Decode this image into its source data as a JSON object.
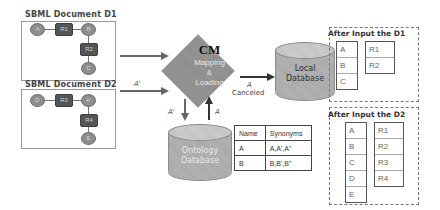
{
  "documents": [
    {
      "title": "SBML Document D1",
      "nodes": {
        "n1": "A",
        "r1": "R1",
        "n2": "B",
        "r2": "R2",
        "n3": "C"
      }
    },
    {
      "title": "SBML Document D2",
      "nodes": {
        "n1": "D",
        "r1": "R3",
        "n2": "A'",
        "r2": "R4",
        "n3": "E"
      }
    }
  ],
  "edges": {
    "d2_to_cm_label": "A'",
    "cm_to_ontology_label": "A'",
    "ontology_to_cm_label": "A",
    "cm_to_local_label": "A",
    "cm_to_local_sublabel": "Canceled"
  },
  "cm": {
    "title": "CM",
    "line1": "Mapping",
    "line2": "&",
    "line3": "Loading"
  },
  "local_db": {
    "line1": "Local",
    "line2": "Database"
  },
  "ontology_db": {
    "line1": "Ontology",
    "line2": "Database"
  },
  "synonym_table": {
    "headers": [
      "Name",
      "Synonyms"
    ],
    "rows": [
      [
        "A",
        "A,A',A''"
      ],
      [
        "B",
        "B,B',B''"
      ]
    ]
  },
  "after_d1": {
    "title": "After Input the D1",
    "species": [
      "A",
      "B",
      "C"
    ],
    "reactions": [
      "R1",
      "R2"
    ]
  },
  "after_d2": {
    "title": "After Input the D2",
    "species": [
      "A",
      "B",
      "C",
      "D",
      "E"
    ],
    "reactions": [
      "R1",
      "R2",
      "R3",
      "R4"
    ]
  },
  "colors": {
    "node_circle": "#8d8d8d",
    "node_rect": "#555555",
    "diamond": "#8e8e8e",
    "cylinder": "#a9a9a9",
    "arrow": "#666666"
  }
}
